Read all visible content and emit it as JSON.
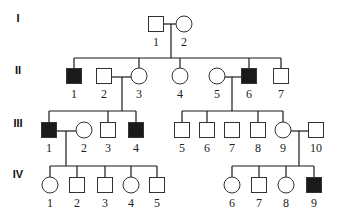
{
  "colors": {
    "affected": "#1a1a1a",
    "unaffected": "#ffffff",
    "line": "#1a1a1a"
  },
  "generations": [
    {
      "label": "I",
      "y": 22
    },
    {
      "label": "II",
      "y": 74
    },
    {
      "label": "III",
      "y": 127
    },
    {
      "label": "IV",
      "y": 178
    }
  ],
  "individuals": [
    {
      "id": "I-1",
      "num": "1",
      "sex": "male",
      "affected": false,
      "x": 156,
      "y": 24
    },
    {
      "id": "I-2",
      "num": "2",
      "sex": "female",
      "affected": false,
      "x": 184,
      "y": 24
    },
    {
      "id": "II-1",
      "num": "1",
      "sex": "male",
      "affected": true,
      "x": 74,
      "y": 76
    },
    {
      "id": "II-2",
      "num": "2",
      "sex": "male",
      "affected": false,
      "x": 104,
      "y": 76
    },
    {
      "id": "II-3",
      "num": "3",
      "sex": "female",
      "affected": false,
      "x": 139,
      "y": 76
    },
    {
      "id": "II-4",
      "num": "4",
      "sex": "female",
      "affected": false,
      "x": 180,
      "y": 76
    },
    {
      "id": "II-5",
      "num": "5",
      "sex": "female",
      "affected": false,
      "x": 217,
      "y": 76
    },
    {
      "id": "II-6",
      "num": "6",
      "sex": "male",
      "affected": true,
      "x": 249,
      "y": 76
    },
    {
      "id": "II-7",
      "num": "7",
      "sex": "male",
      "affected": false,
      "x": 281,
      "y": 76
    },
    {
      "id": "III-1",
      "num": "1",
      "sex": "male",
      "affected": true,
      "x": 49,
      "y": 130
    },
    {
      "id": "III-2",
      "num": "2",
      "sex": "female",
      "affected": false,
      "x": 84,
      "y": 130
    },
    {
      "id": "III-3",
      "num": "3",
      "sex": "male",
      "affected": false,
      "x": 108,
      "y": 130
    },
    {
      "id": "III-4",
      "num": "4",
      "sex": "male",
      "affected": true,
      "x": 136,
      "y": 130
    },
    {
      "id": "III-5",
      "num": "5",
      "sex": "male",
      "affected": false,
      "x": 182,
      "y": 130
    },
    {
      "id": "III-6",
      "num": "6",
      "sex": "male",
      "affected": false,
      "x": 207,
      "y": 130
    },
    {
      "id": "III-7",
      "num": "7",
      "sex": "male",
      "affected": false,
      "x": 232,
      "y": 130
    },
    {
      "id": "III-8",
      "num": "8",
      "sex": "male",
      "affected": false,
      "x": 258,
      "y": 130
    },
    {
      "id": "III-9",
      "num": "9",
      "sex": "female",
      "affected": false,
      "x": 283,
      "y": 130
    },
    {
      "id": "III-10",
      "num": "10",
      "sex": "male",
      "affected": false,
      "x": 316,
      "y": 130
    },
    {
      "id": "IV-1",
      "num": "1",
      "sex": "female",
      "affected": false,
      "x": 50,
      "y": 185
    },
    {
      "id": "IV-2",
      "num": "2",
      "sex": "male",
      "affected": false,
      "x": 77,
      "y": 185
    },
    {
      "id": "IV-3",
      "num": "3",
      "sex": "male",
      "affected": false,
      "x": 105,
      "y": 185
    },
    {
      "id": "IV-4",
      "num": "4",
      "sex": "female",
      "affected": false,
      "x": 131,
      "y": 185
    },
    {
      "id": "IV-5",
      "num": "5",
      "sex": "male",
      "affected": false,
      "x": 157,
      "y": 185
    },
    {
      "id": "IV-6",
      "num": "6",
      "sex": "female",
      "affected": false,
      "x": 232,
      "y": 185
    },
    {
      "id": "IV-7",
      "num": "7",
      "sex": "male",
      "affected": false,
      "x": 259,
      "y": 185
    },
    {
      "id": "IV-8",
      "num": "8",
      "sex": "female",
      "affected": false,
      "x": 286,
      "y": 185
    },
    {
      "id": "IV-9",
      "num": "9",
      "sex": "male",
      "affected": true,
      "x": 314,
      "y": 185
    }
  ],
  "lines": [
    [
      164,
      24,
      176,
      24
    ],
    [
      171,
      24,
      171,
      58
    ],
    [
      74,
      58,
      281,
      58
    ],
    [
      74,
      58,
      74,
      68
    ],
    [
      139,
      58,
      139,
      68
    ],
    [
      180,
      58,
      180,
      68
    ],
    [
      249,
      58,
      249,
      68
    ],
    [
      281,
      58,
      281,
      68
    ],
    [
      112,
      77,
      131,
      77
    ],
    [
      122,
      77,
      122,
      111
    ],
    [
      49,
      111,
      136,
      111
    ],
    [
      49,
      111,
      49,
      122
    ],
    [
      108,
      111,
      108,
      122
    ],
    [
      136,
      111,
      136,
      122
    ],
    [
      225,
      77,
      241,
      77
    ],
    [
      232,
      77,
      232,
      111
    ],
    [
      182,
      111,
      283,
      111
    ],
    [
      182,
      111,
      182,
      122
    ],
    [
      207,
      111,
      207,
      122
    ],
    [
      258,
      111,
      258,
      122
    ],
    [
      283,
      111,
      283,
      122
    ],
    [
      57,
      131,
      76,
      131
    ],
    [
      66,
      131,
      66,
      166
    ],
    [
      50,
      166,
      157,
      166
    ],
    [
      50,
      166,
      50,
      177
    ],
    [
      77,
      166,
      77,
      177
    ],
    [
      105,
      166,
      105,
      177
    ],
    [
      131,
      166,
      131,
      177
    ],
    [
      157,
      166,
      157,
      177
    ],
    [
      291,
      131,
      308,
      131
    ],
    [
      299,
      131,
      299,
      166
    ],
    [
      232,
      166,
      314,
      166
    ],
    [
      232,
      166,
      232,
      177
    ],
    [
      259,
      166,
      259,
      177
    ],
    [
      286,
      166,
      286,
      177
    ],
    [
      314,
      166,
      314,
      177
    ]
  ]
}
